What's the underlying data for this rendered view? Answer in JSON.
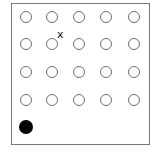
{
  "grid": {
    "rows": 4,
    "cols": 5,
    "col_x": [
      26,
      52,
      79,
      106,
      134
    ],
    "row_y": [
      17,
      44,
      72,
      100
    ],
    "circle_color": "#6e6e6e"
  },
  "marker": {
    "label": "x",
    "row": 1,
    "col": 1
  },
  "player": {
    "color": "#000000",
    "x": 26,
    "y": 127
  }
}
